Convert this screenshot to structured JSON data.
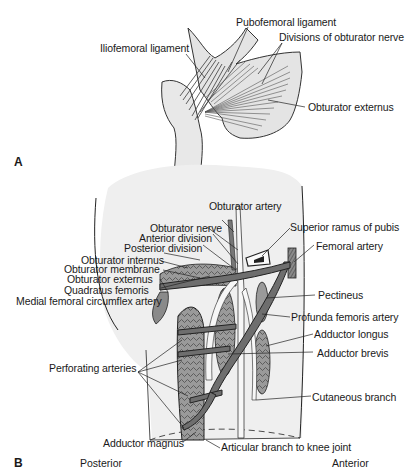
{
  "figure": {
    "panels": [
      {
        "id": "A",
        "label": "A",
        "callouts": [
          {
            "text": "Pubofemoral ligament"
          },
          {
            "text": "Iliofemoral ligament"
          },
          {
            "text": "Divisions of obturator nerve"
          },
          {
            "text": "Obturator externus"
          }
        ]
      },
      {
        "id": "B",
        "label": "B",
        "callouts": [
          {
            "text": "Obturator artery"
          },
          {
            "text": "Obturator nerve"
          },
          {
            "text": "Anterior division"
          },
          {
            "text": "Posterior division"
          },
          {
            "text": "Obturator internus"
          },
          {
            "text": "Obturator membrane"
          },
          {
            "text": "Obturator externus"
          },
          {
            "text": "Quadratus femoris"
          },
          {
            "text": "Medial femoral circumflex artery"
          },
          {
            "text": "Superior ramus of pubis"
          },
          {
            "text": "Femoral artery"
          },
          {
            "text": "Pectineus"
          },
          {
            "text": "Profunda femoris artery"
          },
          {
            "text": "Adductor longus"
          },
          {
            "text": "Adductor brevis"
          },
          {
            "text": "Perforating arteries"
          },
          {
            "text": "Cutaneous branch"
          },
          {
            "text": "Adductor magnus"
          },
          {
            "text": "Articular branch to knee joint"
          }
        ],
        "orientation": {
          "left": "Posterior",
          "right": "Anterior"
        }
      }
    ]
  }
}
